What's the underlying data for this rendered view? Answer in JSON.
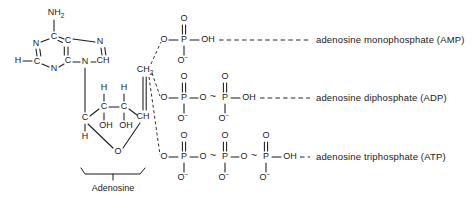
{
  "figure": {
    "background_color": "#ffffff",
    "ink_color": "#1a1a1a"
  },
  "adenine": {
    "amine_label": "NH",
    "amine_subscript": "2",
    "atoms": [
      {
        "id": "n1",
        "label": "N"
      },
      {
        "id": "c2",
        "label": "C"
      },
      {
        "id": "n3",
        "label": "N"
      },
      {
        "id": "c4",
        "label": "C"
      },
      {
        "id": "c5",
        "label": "C"
      },
      {
        "id": "c6",
        "label": "C"
      },
      {
        "id": "n7",
        "label": "N"
      },
      {
        "id": "c8",
        "label": "CH"
      },
      {
        "id": "n9",
        "label": "N"
      },
      {
        "id": "h2",
        "label": "H"
      }
    ]
  },
  "ribose": {
    "atoms": [
      {
        "id": "c1",
        "label": "C"
      },
      {
        "id": "c1_h",
        "label": "H"
      },
      {
        "id": "c2",
        "label": "C"
      },
      {
        "id": "c2_h",
        "label": "H"
      },
      {
        "id": "c2_oh",
        "label": "OH"
      },
      {
        "id": "c3",
        "label": "C"
      },
      {
        "id": "c3_h",
        "label": "H"
      },
      {
        "id": "c3_oh",
        "label": "OH"
      },
      {
        "id": "c4",
        "label": "CH"
      },
      {
        "id": "ring_o",
        "label": "O"
      },
      {
        "id": "c5",
        "label": "CH",
        "subscript": "2"
      }
    ]
  },
  "bracket": {
    "label": "Adenosine"
  },
  "atom_labels": {
    "oxygen": "O",
    "phosphorus": "P",
    "hydroxyl": "OH",
    "oxide_anion": "O",
    "anion_charge": "−",
    "high_energy_bond": "~"
  },
  "rows": [
    {
      "id": "amp",
      "phosphate_count": 1,
      "label": "adenosine  monophosphate  (AMP)",
      "terminal_group": "OH",
      "high_energy_bonds": 0
    },
    {
      "id": "adp",
      "phosphate_count": 2,
      "label": "adenosine  diphosphate  (ADP)",
      "terminal_group": "OH",
      "high_energy_bonds": 1
    },
    {
      "id": "atp",
      "phosphate_count": 3,
      "label": "adenosine  triphosphate  (ATP)",
      "terminal_group": "OH",
      "high_energy_bonds": 2
    }
  ]
}
